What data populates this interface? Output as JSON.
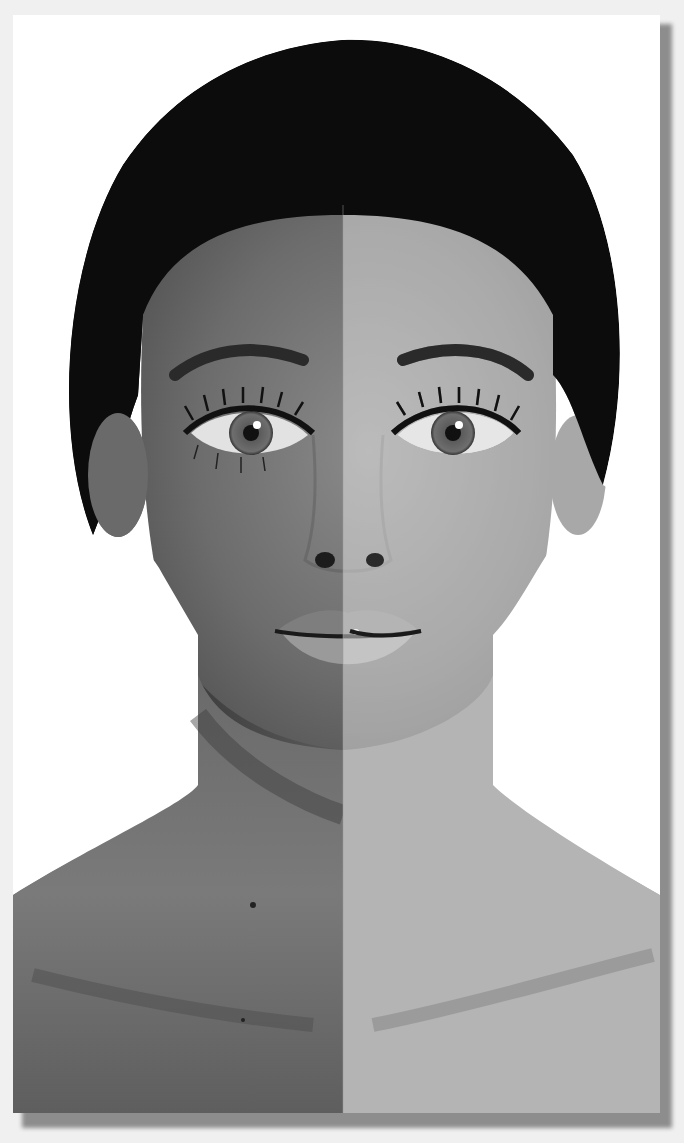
{
  "photo": {
    "subject": "split-tone portrait of a woman",
    "style": "black-and-white",
    "split_x": 330,
    "halves": [
      {
        "side": "left",
        "description": "darker, textured skin",
        "tone": "#6e6e6e"
      },
      {
        "side": "right",
        "description": "lighter, smooth skin",
        "tone": "#b4b4b4"
      }
    ]
  },
  "colors": {
    "background": "#f0f0f0",
    "print_border": "#ffffff",
    "shadow": "#8d8d8d",
    "hair": "#0c0c0c",
    "skin_left": "#6f6f6f",
    "skin_right": "#b8b8b8"
  }
}
